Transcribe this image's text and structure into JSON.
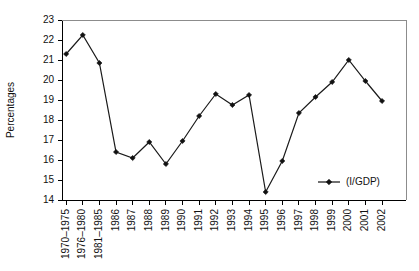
{
  "chart_data": {
    "type": "line",
    "title": "",
    "xlabel": "",
    "ylabel": "Percentages",
    "ylim": [
      14,
      23
    ],
    "yticks": [
      14,
      15,
      16,
      17,
      18,
      19,
      20,
      21,
      22,
      23
    ],
    "grid": false,
    "legend_position": "bottom-right",
    "legend": [
      "(I/GDP)"
    ],
    "marker": "diamond",
    "line_color": "#111111",
    "categories": [
      "1970–1975",
      "1976–1980",
      "1981–1985",
      "1986",
      "1987",
      "1988",
      "1989",
      "1990",
      "1991",
      "1992",
      "1993",
      "1994",
      "1995",
      "1996",
      "1997",
      "1998",
      "1999",
      "2000",
      "2001",
      "2002"
    ],
    "series": [
      {
        "name": "(I/GDP)",
        "values": [
          21.3,
          22.25,
          20.85,
          16.4,
          16.1,
          16.9,
          15.8,
          16.95,
          18.2,
          19.3,
          18.75,
          19.25,
          14.4,
          15.95,
          18.35,
          19.15,
          19.9,
          21.0,
          19.95,
          18.95
        ]
      }
    ]
  },
  "axis": {
    "y_title": "Percentages"
  },
  "legend": {
    "entry_label": "(I/GDP)"
  }
}
